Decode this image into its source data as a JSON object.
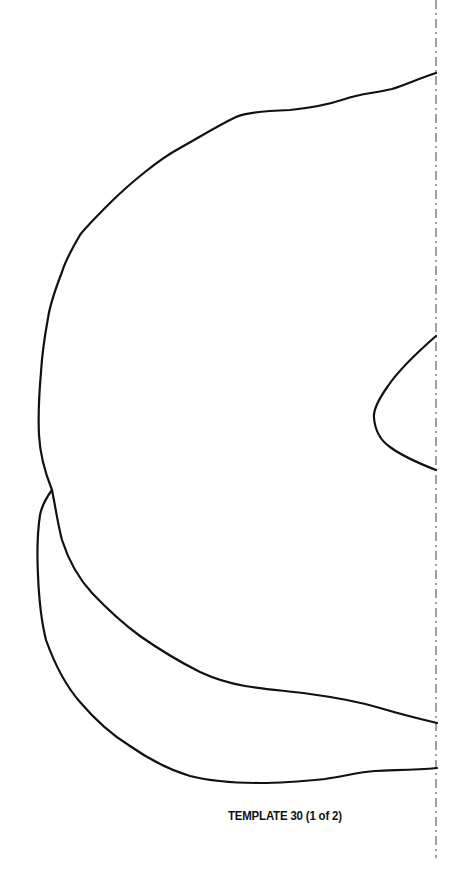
{
  "page": {
    "background": "#ffffff"
  },
  "template": {
    "label": "TEMPLATE 30 (1 of 2)",
    "number": 30,
    "part": 1,
    "total_parts": 2
  },
  "diagram": {
    "stroke_color": "#111111",
    "fold_line_color": "#555555",
    "fold_line_style": "dash-dot",
    "fold_line_x": 436,
    "shapes": [
      {
        "name": "main-body-outline",
        "description": "large curved outer body outline"
      },
      {
        "name": "inner-notch-outline",
        "description": "small curved notch against fold line"
      },
      {
        "name": "bottom-flap-outline",
        "description": "crescent-shaped flap below main body"
      }
    ]
  }
}
